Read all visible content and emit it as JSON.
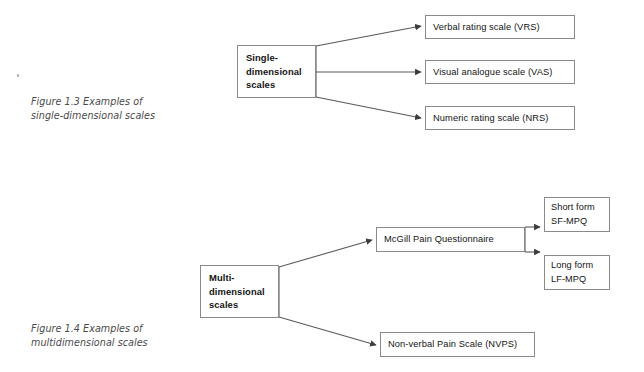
{
  "page": {
    "background": "#ffffff",
    "line_color": "#5a5a5a",
    "box_border_color": "#8a8a8a",
    "text_color": "#131313",
    "caption_color": "#4a4a4a"
  },
  "figures": [
    {
      "id": "figure-1-3",
      "caption": "Figure 1.3  Examples of\nsingle-dimensional scales",
      "root": {
        "label": "Single-\ndimensional\nscales"
      },
      "children": [
        {
          "label": "Verbal rating scale (VRS)"
        },
        {
          "label": "Visual analogue scale (VAS)"
        },
        {
          "label": "Numeric rating scale (NRS)"
        }
      ]
    },
    {
      "id": "figure-1-4",
      "caption": "Figure 1.4  Examples of\nmultidimensional scales",
      "root": {
        "label": "Multi-\ndimensional\nscales"
      },
      "children": [
        {
          "label": "McGill Pain Questionnaire"
        },
        {
          "label": "Non-verbal Pain Scale (NVPS)"
        }
      ],
      "grandchildren": [
        {
          "label": "Short form\nSF-MPQ"
        },
        {
          "label": "Long form\nLF-MPQ"
        }
      ]
    }
  ]
}
